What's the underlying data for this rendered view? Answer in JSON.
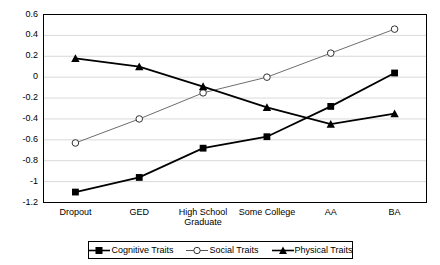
{
  "chart_data": {
    "type": "line",
    "title": "",
    "xlabel": "",
    "ylabel": "",
    "categories": [
      "Dropout",
      "GED",
      "High School Graduate",
      "Some College",
      "AA",
      "BA"
    ],
    "series": [
      {
        "name": "Cognitive Traits",
        "marker": "filled-square",
        "color": "#000000",
        "values": [
          -1.1,
          -0.96,
          -0.68,
          -0.57,
          -0.28,
          0.04
        ]
      },
      {
        "name": "Social Traits",
        "marker": "open-circle",
        "color": "#808080",
        "values": [
          -0.63,
          -0.4,
          -0.15,
          0.0,
          0.23,
          0.46
        ]
      },
      {
        "name": "Physical Traits",
        "marker": "filled-triangle",
        "color": "#000000",
        "values": [
          0.18,
          0.1,
          -0.09,
          -0.29,
          -0.45,
          -0.35
        ]
      }
    ],
    "ylim": [
      -1.2,
      0.6
    ],
    "ytick_labels": [
      "0.6",
      "0.4",
      "0.2",
      "0",
      "-0.2",
      "-0.4",
      "-0.6",
      "-0.8",
      "-1",
      "-1.2"
    ],
    "ytick_values": [
      0.6,
      0.4,
      0.2,
      0,
      -0.2,
      -0.4,
      -0.6,
      -0.8,
      -1,
      -1.2
    ],
    "grid": true,
    "legend_position": "bottom"
  }
}
